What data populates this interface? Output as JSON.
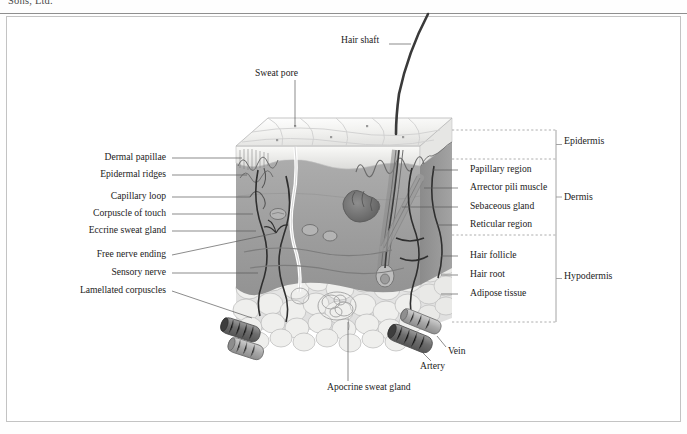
{
  "page": {
    "running_head": "Sons, Ltd."
  },
  "figure": {
    "labels_left": [
      {
        "name": "dermal-papillae",
        "text": "Dermal papillae",
        "x": 166,
        "y": 157,
        "lx1": 172,
        "ly1": 158,
        "lx2": 242,
        "ly2": 158
      },
      {
        "name": "epidermal-ridges",
        "text": "Epidermal ridges",
        "x": 166,
        "y": 174,
        "lx1": 172,
        "ly1": 175,
        "lx2": 247,
        "ly2": 175
      },
      {
        "name": "capillary-loop",
        "text": "Capillary loop",
        "x": 166,
        "y": 196,
        "lx1": 172,
        "ly1": 197,
        "lx2": 250,
        "ly2": 197
      },
      {
        "name": "corpuscle-of-touch",
        "text": "Corpuscle of touch",
        "x": 166,
        "y": 213,
        "lx1": 172,
        "ly1": 214,
        "lx2": 253,
        "ly2": 214
      },
      {
        "name": "eccrine-sweat-gland",
        "text": "Eccrine sweat gland",
        "x": 166,
        "y": 230,
        "lx1": 172,
        "ly1": 231,
        "lx2": 256,
        "ly2": 231
      },
      {
        "name": "free-nerve-ending",
        "text": "Free nerve ending",
        "x": 166,
        "y": 254,
        "lx1": 172,
        "ly1": 255,
        "lx2": 276,
        "ly2": 233
      },
      {
        "name": "sensory-nerve",
        "text": "Sensory nerve",
        "x": 166,
        "y": 272,
        "lx1": 172,
        "ly1": 273,
        "lx2": 258,
        "ly2": 273
      },
      {
        "name": "lamellated-corpuscles",
        "text": "Lamellated corpuscles",
        "x": 166,
        "y": 290,
        "lx1": 172,
        "ly1": 291,
        "lx2": 252,
        "ly2": 318
      }
    ],
    "labels_right": [
      {
        "name": "papillary-region",
        "text": "Papillary region",
        "x": 470,
        "y": 169,
        "lx1": 458,
        "ly1": 170,
        "lx2": 432,
        "ly2": 170
      },
      {
        "name": "arrector-pili-muscle",
        "text": "Arrector pili muscle",
        "x": 470,
        "y": 187,
        "lx1": 458,
        "ly1": 188,
        "lx2": 424,
        "ly2": 188
      },
      {
        "name": "sebaceous-gland",
        "text": "Sebaceous gland",
        "x": 470,
        "y": 206,
        "lx1": 458,
        "ly1": 207,
        "lx2": 402,
        "ly2": 207
      },
      {
        "name": "reticular-region",
        "text": "Reticular region",
        "x": 470,
        "y": 224,
        "lx1": 458,
        "ly1": 225,
        "lx2": 437,
        "ly2": 225
      },
      {
        "name": "hair-follicle",
        "text": "Hair follicle",
        "x": 470,
        "y": 255,
        "lx1": 458,
        "ly1": 256,
        "lx2": 441,
        "ly2": 256
      },
      {
        "name": "hair-root",
        "text": "Hair root",
        "x": 470,
        "y": 274,
        "lx1": 458,
        "ly1": 275,
        "lx2": 441,
        "ly2": 275
      },
      {
        "name": "adipose-tissue",
        "text": "Adipose tissue",
        "x": 470,
        "y": 293,
        "lx1": 458,
        "ly1": 294,
        "lx2": 441,
        "ly2": 294
      }
    ],
    "labels_top": [
      {
        "name": "hair-shaft",
        "text": "Hair shaft",
        "x": 341,
        "y": 40,
        "lx1": 389,
        "ly1": 44,
        "lx2": 411,
        "ly2": 44
      },
      {
        "name": "sweat-pore",
        "text": "Sweat pore",
        "x": 255,
        "y": 73,
        "lx1": 295,
        "ly1": 80,
        "lx2": 295,
        "ly2": 126
      }
    ],
    "labels_bottom": [
      {
        "name": "vein",
        "text": "Vein",
        "x": 448,
        "y": 351,
        "lx1": 446,
        "ly1": 347,
        "lx2": 437,
        "ly2": 336
      },
      {
        "name": "artery",
        "text": "Artery",
        "x": 420,
        "y": 366,
        "lx1": 431,
        "ly1": 361,
        "lx2": 419,
        "ly2": 349
      },
      {
        "name": "apocrine-sweat-gland",
        "text": "Apocrine sweat gland",
        "x": 327,
        "y": 387,
        "lx1": 348,
        "ly1": 381,
        "lx2": 348,
        "ly2": 322
      }
    ],
    "layers": [
      {
        "name": "epidermis",
        "text": "Epidermis",
        "x": 564,
        "y": 141,
        "top": 130,
        "bottom": 159
      },
      {
        "name": "dermis",
        "text": "Dermis",
        "x": 564,
        "y": 197,
        "top": 159,
        "bottom": 235
      },
      {
        "name": "hypodermis",
        "text": "Hypodermis",
        "x": 564,
        "y": 276,
        "top": 235,
        "bottom": 322
      }
    ],
    "colors": {
      "epidermis_top": "#f4f4f2",
      "epidermis_band": "#d8d8d6",
      "dermis": "#9e9e9e",
      "dermis_dark": "#8a8a8a",
      "hypodermis": "#e6e6e4",
      "vessel_dark": "#6f6f6f",
      "nerve": "#2e2e2e",
      "hair": "#3a3a3a",
      "leader": "#5a5a5a",
      "bracket": "#9a9a9a"
    }
  }
}
